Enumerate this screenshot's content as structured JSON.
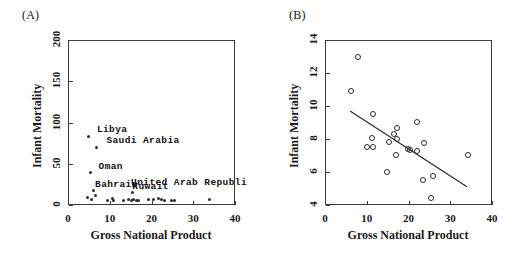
{
  "figure": {
    "panels": [
      {
        "tag": "(A)",
        "xlabel": "Gross National Product",
        "ylabel": "Infant Mortality",
        "xticks": [
          "0",
          "10",
          "20",
          "30",
          "40"
        ],
        "yticks": [
          "0",
          "50",
          "100",
          "150",
          "200"
        ]
      },
      {
        "tag": "(B)",
        "xlabel": "Gross National Product",
        "ylabel": "Infant Mortality",
        "xticks": [
          "0",
          "10",
          "20",
          "30",
          "40"
        ],
        "yticks": [
          "4",
          "6",
          "8",
          "10",
          "12",
          "14"
        ]
      }
    ],
    "annotations": {
      "libya": "Libya",
      "saudi_arabia": "Saudi Arabia",
      "oman": "Oman",
      "bahrain": "Bahrain",
      "kuwait": "Kuwait",
      "united_arab_republic": "United Arab Republi"
    }
  },
  "chart_data": [
    {
      "type": "scatter",
      "title": "(A)",
      "xlabel": "Gross National Product",
      "ylabel": "Infant Mortality",
      "xlim": [
        0,
        40
      ],
      "ylim": [
        0,
        200
      ],
      "xticks": [
        0,
        10,
        20,
        30,
        40
      ],
      "yticks": [
        0,
        50,
        100,
        150,
        200
      ],
      "grid": false,
      "legend": "none",
      "marker": "small-dot",
      "points": [
        {
          "x": 5.0,
          "y": 83,
          "label": "Libya"
        },
        {
          "x": 6.8,
          "y": 70,
          "label": "Saudi Arabia"
        },
        {
          "x": 5.4,
          "y": 40,
          "label": "Oman"
        },
        {
          "x": 6.0,
          "y": 17,
          "label": "Bahrain"
        },
        {
          "x": 15.4,
          "y": 15,
          "label": "Kuwait"
        },
        {
          "x": 4.6,
          "y": 9,
          "label": ""
        },
        {
          "x": 5.6,
          "y": 7,
          "label": ""
        },
        {
          "x": 6.6,
          "y": 11,
          "label": ""
        },
        {
          "x": 9.4,
          "y": 6,
          "label": ""
        },
        {
          "x": 10.6,
          "y": 8,
          "label": ""
        },
        {
          "x": 11.0,
          "y": 5,
          "label": ""
        },
        {
          "x": 13.4,
          "y": 5,
          "label": ""
        },
        {
          "x": 14.6,
          "y": 7,
          "label": ""
        },
        {
          "x": 15.2,
          "y": 6,
          "label": ""
        },
        {
          "x": 15.8,
          "y": 7,
          "label": ""
        },
        {
          "x": 16.4,
          "y": 6,
          "label": ""
        },
        {
          "x": 17.0,
          "y": 5,
          "label": ""
        },
        {
          "x": 19.4,
          "y": 7,
          "label": ""
        },
        {
          "x": 20.4,
          "y": 7,
          "label": ""
        },
        {
          "x": 21.6,
          "y": 8,
          "label": ""
        },
        {
          "x": 22.4,
          "y": 7,
          "label": ""
        },
        {
          "x": 23.0,
          "y": 6,
          "label": ""
        },
        {
          "x": 24.8,
          "y": 5,
          "label": ""
        },
        {
          "x": 25.6,
          "y": 5,
          "label": ""
        },
        {
          "x": 33.8,
          "y": 7,
          "label": "United Arab Republi"
        }
      ]
    },
    {
      "type": "scatter",
      "title": "(B)",
      "xlabel": "Gross National Product",
      "ylabel": "Infant Mortality",
      "xlim": [
        0,
        40
      ],
      "ylim": [
        4,
        14
      ],
      "xticks": [
        0,
        10,
        20,
        30,
        40
      ],
      "yticks": [
        4,
        6,
        8,
        10,
        12,
        14
      ],
      "grid": false,
      "legend": "none",
      "marker": "open-circle",
      "points": [
        {
          "x": 7.6,
          "y": 13.05
        },
        {
          "x": 5.9,
          "y": 11.0
        },
        {
          "x": 11.2,
          "y": 9.6
        },
        {
          "x": 21.8,
          "y": 9.1
        },
        {
          "x": 17.0,
          "y": 8.75
        },
        {
          "x": 16.2,
          "y": 8.35
        },
        {
          "x": 11.0,
          "y": 8.1
        },
        {
          "x": 17.1,
          "y": 8.05
        },
        {
          "x": 15.2,
          "y": 7.9
        },
        {
          "x": 23.4,
          "y": 7.8
        },
        {
          "x": 9.8,
          "y": 7.55
        },
        {
          "x": 11.3,
          "y": 7.55
        },
        {
          "x": 19.7,
          "y": 7.45
        },
        {
          "x": 20.1,
          "y": 7.4
        },
        {
          "x": 21.9,
          "y": 7.35
        },
        {
          "x": 16.8,
          "y": 7.1
        },
        {
          "x": 33.9,
          "y": 7.1
        },
        {
          "x": 14.6,
          "y": 6.05
        },
        {
          "x": 23.3,
          "y": 5.6
        },
        {
          "x": 25.6,
          "y": 5.8
        },
        {
          "x": 25.2,
          "y": 4.5
        }
      ],
      "fit_line": {
        "type": "linear",
        "x_start": 6.0,
        "y_start": 9.7,
        "x_end": 34.0,
        "y_end": 5.1
      }
    }
  ]
}
